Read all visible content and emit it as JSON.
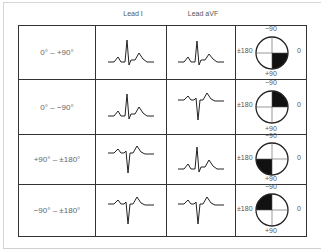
{
  "headers": {
    "lead_i": "Lead I",
    "lead_avf": "Lead aVF"
  },
  "rows": [
    {
      "range": "0° – +90°",
      "lead_i": "positive",
      "lead_avf": "positive",
      "quadrant": "bottom-right"
    },
    {
      "range": "0° – −90°",
      "lead_i": "positive",
      "lead_avf": "negative",
      "quadrant": "top-right"
    },
    {
      "range": "+90° – ±180°",
      "lead_i": "negative",
      "lead_avf": "positive",
      "quadrant": "bottom-left"
    },
    {
      "range": "−90° – ±180°",
      "lead_i": "negative",
      "lead_avf": "negative",
      "quadrant": "top-left"
    }
  ],
  "axis_labels": {
    "top": "−90",
    "bottom": "+90",
    "left": "±180",
    "right": "0"
  }
}
